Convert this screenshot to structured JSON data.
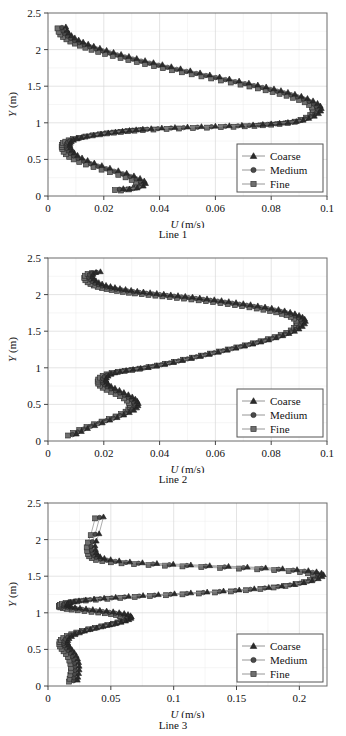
{
  "figure": {
    "panel_count": 3,
    "shared_legend_entries": [
      {
        "label": "Coarse",
        "marker": "triangle"
      },
      {
        "label": "Medium",
        "marker": "circle"
      },
      {
        "label": "Fine",
        "marker": "square"
      }
    ],
    "colors": {
      "coarse": "#2b2b2b",
      "medium": "#4a4a4a",
      "fine": "#6f6f6f",
      "line": "#8a8a8a",
      "grid": "#d8d8d8",
      "axis": "#555555",
      "text": "#111111",
      "background": "#ffffff"
    }
  },
  "panels": [
    {
      "caption": "Line 1",
      "xlabel_var": "U",
      "xlabel_unit": "(m/s)",
      "ylabel_var": "Y",
      "ylabel_unit": "(m)",
      "xticks": [
        "0",
        "0.02",
        "0.04",
        "0.06",
        "0.08",
        "0.1"
      ],
      "yticks": [
        "0",
        "0.5",
        "1",
        "1.5",
        "2",
        "2.5"
      ],
      "legend": [
        "Coarse",
        "Medium",
        "Fine"
      ]
    },
    {
      "caption": "Line 2",
      "xlabel_var": "U",
      "xlabel_unit": "(m/s)",
      "ylabel_var": "Y",
      "ylabel_unit": "(m)",
      "xticks": [
        "0",
        "0.02",
        "0.04",
        "0.06",
        "0.08",
        "0.1"
      ],
      "yticks": [
        "0",
        "0.5",
        "1",
        "1.5",
        "2",
        "2.5"
      ],
      "legend": [
        "Coarse",
        "Medium",
        "Fine"
      ]
    },
    {
      "caption": "Line 3",
      "xlabel_var": "U",
      "xlabel_unit": "(m/s)",
      "ylabel_var": "Y",
      "ylabel_unit": "(m)",
      "xticks": [
        "0",
        "0.05",
        "0.1",
        "0.15",
        "0.2"
      ],
      "yticks": [
        "0",
        "0.5",
        "1",
        "1.5",
        "2",
        "2.5"
      ],
      "legend": [
        "Coarse",
        "Medium",
        "Fine"
      ]
    }
  ],
  "chart_data": [
    {
      "type": "line",
      "title": "Line 1",
      "xlabel": "U (m/s)",
      "ylabel": "Y (m)",
      "xlim": [
        0,
        0.1
      ],
      "ylim": [
        0,
        2.5
      ],
      "xticks": [
        0,
        0.02,
        0.04,
        0.06,
        0.08,
        0.1
      ],
      "yticks": [
        0,
        0.5,
        1,
        1.5,
        2,
        2.5
      ],
      "grid": true,
      "legend_position": "lower-right",
      "series": [
        {
          "name": "Coarse",
          "marker": "triangle",
          "x": [
            0.024,
            0.0262,
            0.029,
            0.0312,
            0.032,
            0.0315,
            0.03,
            0.0278,
            0.0252,
            0.0222,
            0.0192,
            0.0163,
            0.0136,
            0.0112,
            0.0092,
            0.0076,
            0.0064,
            0.0056,
            0.0051,
            0.0049,
            0.005,
            0.0054,
            0.0062,
            0.0074,
            0.009,
            0.011,
            0.0134,
            0.016,
            0.0186,
            0.0212,
            0.0237,
            0.0262,
            0.0286,
            0.031,
            0.034,
            0.0378,
            0.0425,
            0.047,
            0.052,
            0.057,
            0.062,
            0.0665,
            0.0705,
            0.074,
            0.077,
            0.08,
            0.083,
            0.086,
            0.0885,
            0.0905,
            0.0925,
            0.094,
            0.0948,
            0.095,
            0.0946,
            0.0936,
            0.092,
            0.09,
            0.0878,
            0.0855,
            0.083,
            0.0805,
            0.078,
            0.0752,
            0.0722,
            0.069,
            0.0655,
            0.062,
            0.0585,
            0.055,
            0.0515,
            0.048,
            0.0445,
            0.0412,
            0.038,
            0.0348,
            0.0318,
            0.0288,
            0.026,
            0.0232,
            0.0205,
            0.018,
            0.0156,
            0.0134,
            0.0114,
            0.0096,
            0.008,
            0.0066,
            0.0054,
            0.0044,
            0.0038,
            0.0034
          ],
          "y": [
            0.08,
            0.075,
            0.09,
            0.115,
            0.15,
            0.185,
            0.22,
            0.255,
            0.29,
            0.325,
            0.36,
            0.395,
            0.43,
            0.465,
            0.5,
            0.535,
            0.57,
            0.605,
            0.64,
            0.672,
            0.7,
            0.722,
            0.742,
            0.76,
            0.778,
            0.795,
            0.812,
            0.828,
            0.842,
            0.855,
            0.866,
            0.876,
            0.885,
            0.893,
            0.9,
            0.908,
            0.916,
            0.922,
            0.928,
            0.934,
            0.94,
            0.946,
            0.952,
            0.958,
            0.966,
            0.975,
            0.985,
            0.998,
            1.015,
            1.04,
            1.07,
            1.105,
            1.14,
            1.175,
            1.21,
            1.245,
            1.28,
            1.312,
            1.342,
            1.37,
            1.396,
            1.42,
            1.444,
            1.47,
            1.496,
            1.522,
            1.55,
            1.578,
            1.606,
            1.634,
            1.662,
            1.69,
            1.718,
            1.746,
            1.774,
            1.802,
            1.83,
            1.858,
            1.886,
            1.914,
            1.942,
            1.97,
            1.998,
            2.026,
            2.054,
            2.082,
            2.11,
            2.14,
            2.172,
            2.206,
            2.244,
            2.29
          ]
        },
        {
          "name": "Medium",
          "marker": "circle",
          "note": "nearly coincident with Coarse"
        },
        {
          "name": "Fine",
          "marker": "square",
          "note": "nearly coincident with Coarse"
        }
      ]
    },
    {
      "type": "line",
      "title": "Line 2",
      "xlabel": "U (m/s)",
      "ylabel": "Y (m)",
      "xlim": [
        0,
        0.1
      ],
      "ylim": [
        0,
        2.5
      ],
      "xticks": [
        0,
        0.02,
        0.04,
        0.06,
        0.08,
        0.1
      ],
      "yticks": [
        0,
        0.5,
        1,
        1.5,
        2,
        2.5
      ],
      "grid": true,
      "legend_position": "lower-right",
      "series": [
        {
          "name": "Coarse",
          "marker": "triangle",
          "x": [
            0.0072,
            0.009,
            0.0112,
            0.0138,
            0.0165,
            0.0192,
            0.0218,
            0.0242,
            0.0262,
            0.0278,
            0.0288,
            0.0293,
            0.0294,
            0.029,
            0.0283,
            0.0272,
            0.0258,
            0.0242,
            0.0226,
            0.021,
            0.0196,
            0.0186,
            0.018,
            0.0178,
            0.018,
            0.0186,
            0.0196,
            0.021,
            0.0228,
            0.025,
            0.0275,
            0.0302,
            0.033,
            0.036,
            0.039,
            0.042,
            0.0452,
            0.0484,
            0.0516,
            0.0548,
            0.058,
            0.0612,
            0.0644,
            0.0675,
            0.0705,
            0.0734,
            0.0762,
            0.0788,
            0.0812,
            0.0834,
            0.0854,
            0.087,
            0.0882,
            0.089,
            0.0893,
            0.089,
            0.0882,
            0.087,
            0.0855,
            0.0838,
            0.0818,
            0.0796,
            0.0772,
            0.0748,
            0.0722,
            0.0696,
            0.067,
            0.0644,
            0.0618,
            0.0592,
            0.0566,
            0.054,
            0.0514,
            0.0488,
            0.0462,
            0.0436,
            0.041,
            0.0385,
            0.036,
            0.0336,
            0.0312,
            0.029,
            0.0268,
            0.0248,
            0.0228,
            0.021,
            0.0194,
            0.0178,
            0.0164,
            0.0152,
            0.0142,
            0.0134,
            0.013,
            0.0132,
            0.0142,
            0.0158
          ],
          "y": [
            0.075,
            0.11,
            0.15,
            0.19,
            0.228,
            0.265,
            0.3,
            0.335,
            0.368,
            0.4,
            0.432,
            0.462,
            0.492,
            0.522,
            0.552,
            0.582,
            0.612,
            0.642,
            0.672,
            0.7,
            0.728,
            0.756,
            0.784,
            0.812,
            0.84,
            0.866,
            0.89,
            0.91,
            0.928,
            0.944,
            0.958,
            0.972,
            0.988,
            1.008,
            1.03,
            1.055,
            1.082,
            1.11,
            1.138,
            1.166,
            1.194,
            1.222,
            1.25,
            1.278,
            1.306,
            1.334,
            1.362,
            1.39,
            1.418,
            1.448,
            1.478,
            1.51,
            1.545,
            1.58,
            1.614,
            1.645,
            1.672,
            1.696,
            1.718,
            1.738,
            1.758,
            1.776,
            1.794,
            1.81,
            1.826,
            1.842,
            1.856,
            1.87,
            1.884,
            1.898,
            1.91,
            1.922,
            1.934,
            1.946,
            1.956,
            1.966,
            1.976,
            1.986,
            1.996,
            2.006,
            2.016,
            2.026,
            2.038,
            2.05,
            2.062,
            2.076,
            2.09,
            2.106,
            2.124,
            2.144,
            2.168,
            2.196,
            2.226,
            2.258,
            2.282,
            2.292
          ]
        },
        {
          "name": "Medium",
          "marker": "circle",
          "note": "nearly coincident with Coarse"
        },
        {
          "name": "Fine",
          "marker": "square",
          "note": "nearly coincident with Coarse"
        }
      ]
    },
    {
      "type": "line",
      "title": "Line 3",
      "xlabel": "U (m/s)",
      "ylabel": "Y (m)",
      "xlim": [
        0,
        0.222
      ],
      "ylim": [
        0,
        2.5
      ],
      "xticks": [
        0,
        0.05,
        0.1,
        0.15,
        0.2
      ],
      "yticks": [
        0,
        0.5,
        1,
        1.5,
        2,
        2.5
      ],
      "grid": true,
      "legend_position": "lower-right",
      "series": [
        {
          "name": "Coarse",
          "marker": "triangle",
          "x": [
            0.0168,
            0.0172,
            0.0178,
            0.0182,
            0.0182,
            0.0178,
            0.017,
            0.0158,
            0.0142,
            0.0124,
            0.0108,
            0.0096,
            0.009,
            0.0092,
            0.0102,
            0.0122,
            0.015,
            0.0185,
            0.0225,
            0.027,
            0.032,
            0.0372,
            0.0424,
            0.0472,
            0.0516,
            0.0552,
            0.0578,
            0.0594,
            0.0598,
            0.059,
            0.057,
            0.054,
            0.05,
            0.0452,
            0.04,
            0.0346,
            0.029,
            0.0236,
            0.0188,
            0.0148,
            0.0118,
            0.0098,
            0.0088,
            0.0086,
            0.0094,
            0.0112,
            0.014,
            0.018,
            0.0234,
            0.03,
            0.038,
            0.0472,
            0.0575,
            0.069,
            0.0812,
            0.094,
            0.107,
            0.12,
            0.133,
            0.1455,
            0.1575,
            0.169,
            0.1795,
            0.189,
            0.197,
            0.2035,
            0.2085,
            0.2115,
            0.2125,
            0.211,
            0.207,
            0.2005,
            0.1915,
            0.18,
            0.1665,
            0.152,
            0.137,
            0.122,
            0.107,
            0.093,
            0.08,
            0.0685,
            0.0585,
            0.05,
            0.0432,
            0.0382,
            0.0348,
            0.0328,
            0.0318,
            0.0312,
            0.0308,
            0.0318,
            0.034,
            0.0375
          ],
          "y": [
            0.06,
            0.1,
            0.15,
            0.2,
            0.25,
            0.3,
            0.348,
            0.394,
            0.436,
            0.474,
            0.508,
            0.54,
            0.57,
            0.6,
            0.628,
            0.656,
            0.682,
            0.706,
            0.73,
            0.752,
            0.774,
            0.794,
            0.814,
            0.832,
            0.85,
            0.868,
            0.886,
            0.904,
            0.922,
            0.94,
            0.956,
            0.97,
            0.982,
            0.994,
            1.004,
            1.014,
            1.024,
            1.034,
            1.044,
            1.054,
            1.064,
            1.074,
            1.084,
            1.096,
            1.108,
            1.12,
            1.132,
            1.144,
            1.156,
            1.168,
            1.18,
            1.192,
            1.204,
            1.216,
            1.228,
            1.24,
            1.252,
            1.264,
            1.278,
            1.292,
            1.308,
            1.326,
            1.346,
            1.368,
            1.392,
            1.418,
            1.446,
            1.474,
            1.5,
            1.522,
            1.54,
            1.556,
            1.57,
            1.582,
            1.594,
            1.604,
            1.614,
            1.624,
            1.634,
            1.644,
            1.654,
            1.664,
            1.676,
            1.69,
            1.706,
            1.724,
            1.746,
            1.772,
            1.804,
            1.844,
            1.894,
            1.96,
            2.06,
            2.29
          ]
        },
        {
          "name": "Medium",
          "marker": "circle",
          "note": "nearly coincident with Coarse"
        },
        {
          "name": "Fine",
          "marker": "square",
          "note": "nearly coincident with Coarse"
        }
      ]
    }
  ]
}
